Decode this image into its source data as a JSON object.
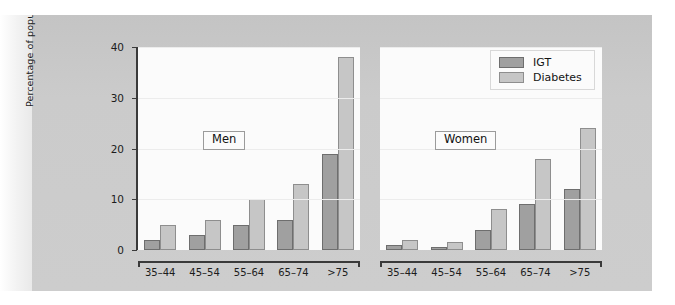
{
  "chart_data": {
    "type": "bar",
    "title": "",
    "xlabel": "",
    "ylabel": "Percentage of population",
    "ylim": [
      0,
      40
    ],
    "yticks": [
      0,
      10,
      20,
      30,
      40
    ],
    "grid": true,
    "legend_position": "top-right",
    "legend": [
      "IGT",
      "Diabetes"
    ],
    "categories": [
      "35–44",
      "45–54",
      "55–64",
      "65–74",
      ">75"
    ],
    "panels": [
      {
        "label": "Men",
        "series": [
          {
            "name": "IGT",
            "values": [
              2,
              3,
              5,
              6,
              19
            ],
            "color": "#a0a0a0"
          },
          {
            "name": "Diabetes",
            "values": [
              5,
              6,
              10,
              13,
              38
            ],
            "color": "#c6c6c6"
          }
        ]
      },
      {
        "label": "Women",
        "series": [
          {
            "name": "IGT",
            "values": [
              1,
              0.5,
              4,
              9,
              12
            ],
            "color": "#a0a0a0"
          },
          {
            "name": "Diabetes",
            "values": [
              2,
              1.5,
              8,
              18,
              24
            ],
            "color": "#c6c6c6"
          }
        ]
      }
    ]
  },
  "axis": {
    "y_label": "Percentage of population",
    "y_ticks": [
      "40",
      "30",
      "20",
      "10",
      "0"
    ],
    "x_ticks": [
      "35–44",
      "45–54",
      "55–64",
      "65–74",
      ">75"
    ]
  },
  "legend": {
    "items": [
      {
        "label": "IGT",
        "swatch": "#a0a0a0"
      },
      {
        "label": "Diabetes",
        "swatch": "#c6c6c6"
      }
    ]
  },
  "panels": {
    "left_tag": "Men",
    "right_tag": "Women"
  },
  "colors": {
    "igt": "#a0a0a0",
    "diabetes": "#c6c6c6",
    "figure_background": "#c9c9c9",
    "plot_background": "#fbfbfb",
    "axis": "#3a3a3a"
  }
}
